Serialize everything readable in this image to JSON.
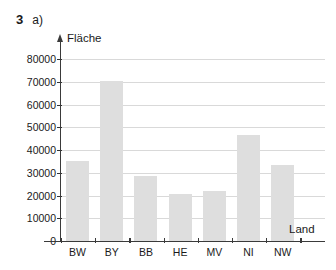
{
  "header": {
    "exercise_number": "3",
    "part_label": "a)"
  },
  "chart_data": {
    "type": "bar",
    "title": "",
    "xlabel": "Land",
    "ylabel": "Fläche",
    "categories": [
      "BW",
      "BY",
      "BB",
      "HE",
      "MV",
      "NI",
      "NW"
    ],
    "values": [
      35000,
      70500,
      28500,
      20500,
      21800,
      46800,
      33500
    ],
    "ylim": [
      0,
      80000
    ],
    "yticks": [
      0,
      10000,
      20000,
      30000,
      40000,
      50000,
      60000,
      70000,
      80000
    ],
    "ytick_labels": [
      "0",
      "10000",
      "20000",
      "30000",
      "40000",
      "50000",
      "60000",
      "70000",
      "80000"
    ],
    "grid": true,
    "legend": "none",
    "bar_color": "#dedede",
    "axis_color": "#3a3a3a",
    "grid_color": "#d9d9d9"
  }
}
